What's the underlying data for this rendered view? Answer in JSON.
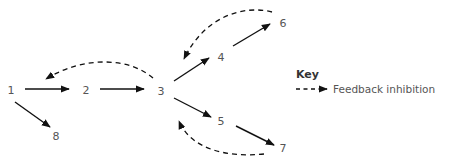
{
  "diagram": {
    "type": "pathway",
    "nodes": [
      {
        "id": "1",
        "label": "1",
        "x": 11,
        "y": 90
      },
      {
        "id": "2",
        "label": "2",
        "x": 86,
        "y": 90
      },
      {
        "id": "3",
        "label": "3",
        "x": 161,
        "y": 91
      },
      {
        "id": "4",
        "label": "4",
        "x": 221,
        "y": 57
      },
      {
        "id": "5",
        "label": "5",
        "x": 221,
        "y": 121
      },
      {
        "id": "6",
        "label": "6",
        "x": 283,
        "y": 23
      },
      {
        "id": "7",
        "label": "7",
        "x": 283,
        "y": 148
      },
      {
        "id": "8",
        "label": "8",
        "x": 56,
        "y": 136
      }
    ],
    "edges": [
      {
        "from": "1",
        "to": "2",
        "style": "solid"
      },
      {
        "from": "2",
        "to": "3",
        "style": "solid"
      },
      {
        "from": "3",
        "to": "4",
        "style": "solid"
      },
      {
        "from": "3",
        "to": "5",
        "style": "solid"
      },
      {
        "from": "4",
        "to": "6",
        "style": "solid"
      },
      {
        "from": "5",
        "to": "7",
        "style": "solid"
      },
      {
        "from": "1",
        "to": "8",
        "style": "solid"
      },
      {
        "from": "3",
        "to": "1",
        "style": "dashed",
        "meaning": "Feedback inhibition"
      },
      {
        "from": "6",
        "to": "4",
        "style": "dashed",
        "meaning": "Feedback inhibition"
      },
      {
        "from": "7",
        "to": "3",
        "style": "dashed",
        "meaning": "Feedback inhibition"
      }
    ]
  },
  "key": {
    "title": "Key",
    "items": [
      {
        "style": "dashed-arrow",
        "label": "Feedback inhibition"
      }
    ]
  }
}
